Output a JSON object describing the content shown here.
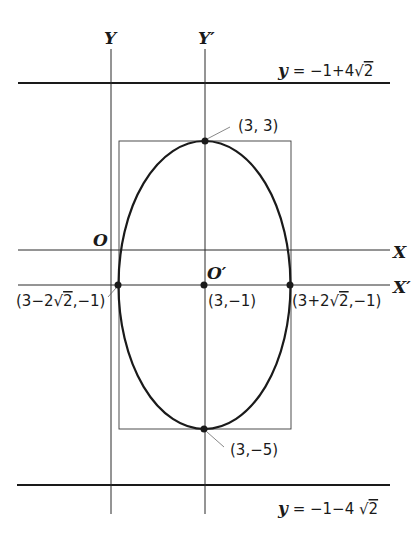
{
  "diagram": {
    "type": "ellipse-with-translated-axes",
    "axes": {
      "original_y_label": "Y",
      "translated_y_label": "Y′",
      "original_x_label": "X",
      "translated_x_label": "X′",
      "original_origin_label": "O",
      "translated_origin_label": "O′"
    },
    "lines": {
      "upper_line_label": "y = −1+4√2",
      "upper_line_lhs": "y",
      "upper_line_rhs": " = −1+4",
      "upper_line_sqrt": "2",
      "lower_line_label": "y = −1−4√2",
      "lower_line_lhs": "y",
      "lower_line_rhs": " = −1−4 ",
      "lower_line_sqrt": "2"
    },
    "points": {
      "top": "(3, 3)",
      "bottom": "(3,−5)",
      "center": "(3,−1)",
      "left_pre": "(3−2",
      "left_sqrt": "2",
      "left_post": ",−1)",
      "left_full": "(3−2√2,−1)",
      "right_pre": "(3+2",
      "right_sqrt": "2",
      "right_post": ",−1)",
      "right_full": "(3+2√2,−1)"
    },
    "ellipse": {
      "center": [
        3,
        -1
      ],
      "semi_major_vertical": 4,
      "semi_minor_horizontal": "2√2"
    }
  }
}
